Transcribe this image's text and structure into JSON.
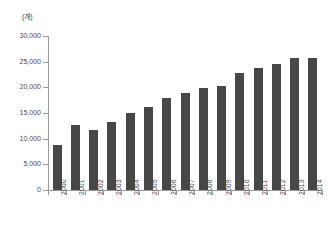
{
  "chart_data": {
    "type": "bar",
    "title": "",
    "subtitle": "",
    "unit_label": "(개)",
    "xlabel": "",
    "ylabel": "",
    "ylim": [
      0,
      30000
    ],
    "ytick_labels": [
      "30,000",
      "25,000",
      "20,000",
      "15,000",
      "10,000",
      "5,000",
      "0"
    ],
    "ytick_values": [
      30000,
      25000,
      20000,
      15000,
      10000,
      5000,
      0
    ],
    "ytick_interval": 5000,
    "grid": false,
    "legend": null,
    "legend_position": "none",
    "bar_color": "#474747",
    "axis_color": "#9a9a9a",
    "text_color": "#4a4a4a",
    "categories": [
      "2000",
      "2001",
      "2002",
      "2003",
      "2004",
      "2005",
      "2006",
      "2007",
      "2008",
      "2009",
      "2010",
      "2011",
      "2012",
      "2013",
      "2014"
    ],
    "values": [
      8700,
      12600,
      11600,
      13200,
      15000,
      16200,
      17900,
      18900,
      19900,
      20200,
      22700,
      23700,
      24500,
      25800,
      25800
    ]
  }
}
